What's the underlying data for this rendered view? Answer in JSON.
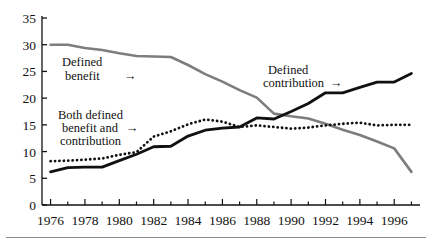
{
  "figure": {
    "background": "#ffffff",
    "bottom_rule_color": "#8a8a8a"
  },
  "annotations": {
    "defined_benefit": {
      "line1": "Defined",
      "line2": "benefit",
      "arrow": "→"
    },
    "both": {
      "line1": "Both defined",
      "line2": "benefit and",
      "line3": "contribution",
      "arrow": "→"
    },
    "defined_contribution": {
      "line1": "Defined",
      "line2": "contribution",
      "arrow": "→"
    }
  },
  "axis": {
    "y_ticks": [
      "0",
      "5",
      "10",
      "15",
      "20",
      "25",
      "30",
      "35"
    ],
    "x_ticks": [
      "1976",
      "1978",
      "1980",
      "1982",
      "1984",
      "1986",
      "1988",
      "1990",
      "1992",
      "1994",
      "1996"
    ]
  },
  "chart_data": {
    "type": "line",
    "title": "",
    "xlabel": "",
    "ylabel": "",
    "xlim": [
      1975.5,
      1997.5
    ],
    "ylim": [
      0,
      35
    ],
    "grid": false,
    "legend_position": "inline-annotations",
    "x": [
      1976,
      1977,
      1978,
      1979,
      1980,
      1981,
      1982,
      1983,
      1984,
      1985,
      1986,
      1987,
      1988,
      1989,
      1990,
      1991,
      1992,
      1993,
      1994,
      1995,
      1996,
      1997
    ],
    "series": [
      {
        "name": "Defined benefit",
        "style": "solid",
        "color": "#7d7d7d",
        "width": 2.6,
        "values": [
          30.0,
          30.0,
          29.4,
          29.0,
          28.4,
          27.9,
          27.8,
          27.7,
          26.2,
          24.5,
          23.1,
          21.5,
          20.1,
          17.1,
          16.6,
          16.2,
          15.2,
          14.1,
          13.1,
          11.9,
          10.6,
          6.2
        ]
      },
      {
        "name": "Both defined benefit and contribution",
        "style": "dotted",
        "color": "#111111",
        "width": 2.8,
        "values": [
          8.2,
          8.3,
          8.5,
          8.7,
          9.4,
          9.9,
          12.8,
          13.8,
          15.1,
          16.0,
          15.6,
          14.6,
          14.9,
          14.6,
          14.3,
          14.5,
          14.9,
          15.2,
          15.4,
          14.9,
          15.0,
          15.0
        ]
      },
      {
        "name": "Defined contribution",
        "style": "solid",
        "color": "#111111",
        "width": 2.8,
        "values": [
          6.2,
          7.0,
          7.1,
          7.1,
          8.3,
          9.5,
          10.9,
          11.0,
          12.9,
          14.0,
          14.4,
          14.6,
          16.3,
          16.1,
          17.5,
          19.0,
          21.0,
          21.0,
          22.0,
          23.0,
          23.0,
          24.6
        ]
      }
    ]
  }
}
